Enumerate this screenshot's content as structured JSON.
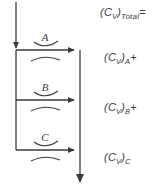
{
  "figure": {
    "type": "series-flow-diagram",
    "background_color": "#ffffff",
    "line_color": "#3b3b3b",
    "text_color": "#3b3b3b"
  },
  "branches": [
    {
      "id": "branch-a",
      "letter": "A"
    },
    {
      "id": "branch-b",
      "letter": "B"
    },
    {
      "id": "branch-c",
      "letter": "C"
    }
  ],
  "equation": {
    "total": {
      "open": "(",
      "symbol": "C",
      "symbol_sub": "V",
      "close": ")",
      "subscript": "Total",
      "operator": "="
    },
    "terms": [
      {
        "open": "(",
        "symbol": "C",
        "symbol_sub": "V",
        "close": ")",
        "subscript": "A",
        "operator": "+"
      },
      {
        "open": "(",
        "symbol": "C",
        "symbol_sub": "V",
        "close": ")",
        "subscript": "B",
        "operator": "+"
      },
      {
        "open": "(",
        "symbol": "C",
        "symbol_sub": "V",
        "close": ")",
        "subscript": "C",
        "operator": ""
      }
    ]
  }
}
